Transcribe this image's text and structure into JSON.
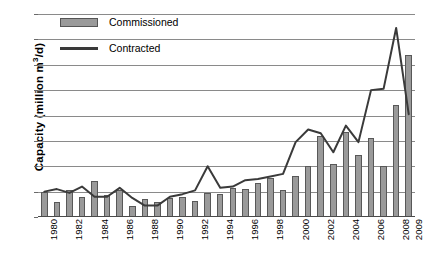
{
  "chart_data": {
    "type": "bar",
    "title": "",
    "xlabel": "",
    "ylabel": "Capacity (million m3/d)",
    "ylabel_prefix": "Capacity (million m",
    "ylabel_sup": "3",
    "ylabel_suffix": "/d)",
    "ylim": [
      0,
      8
    ],
    "yticks": [
      0,
      1,
      2,
      3,
      4,
      5,
      6,
      7,
      8
    ],
    "grid": true,
    "legend_position": "top-left",
    "categories": [
      "1980",
      "1981",
      "1982",
      "1983",
      "1984",
      "1985",
      "1986",
      "1987",
      "1988",
      "1989",
      "1990",
      "1991",
      "1992",
      "1993",
      "1994",
      "1995",
      "1996",
      "1997",
      "1998",
      "1999",
      "2000",
      "2001",
      "2002",
      "2003",
      "2004",
      "2005",
      "2006",
      "2007",
      "2008",
      "2009"
    ],
    "xtick_labels": [
      "1980",
      "",
      "1982",
      "",
      "1984",
      "",
      "1986",
      "",
      "1988",
      "",
      "1990",
      "",
      "1992",
      "",
      "1994",
      "",
      "1996",
      "",
      "1998",
      "",
      "2000",
      "",
      "2002",
      "",
      "2004",
      "",
      "2006",
      "",
      "2008",
      "2009"
    ],
    "series": [
      {
        "name": "Commissioned",
        "type": "bar",
        "color": "#9a9a9a",
        "edge_color": "#585858",
        "values": [
          1.0,
          0.58,
          1.05,
          0.8,
          1.4,
          0.85,
          1.05,
          0.45,
          0.7,
          0.6,
          0.75,
          0.8,
          0.65,
          0.95,
          0.9,
          1.15,
          1.1,
          1.35,
          1.55,
          1.05,
          1.6,
          2.0,
          3.2,
          2.1,
          3.35,
          2.45,
          3.1,
          2.0,
          4.4,
          6.4
        ]
      },
      {
        "name": "Contracted",
        "type": "line",
        "color": "#3a3a3a",
        "values": [
          1.0,
          1.1,
          0.95,
          1.2,
          0.8,
          0.8,
          1.15,
          0.75,
          0.45,
          0.45,
          0.8,
          0.9,
          1.05,
          2.0,
          1.15,
          1.2,
          1.45,
          1.5,
          1.6,
          1.7,
          2.95,
          3.45,
          3.3,
          2.55,
          3.6,
          2.95,
          5.0,
          5.05,
          7.45,
          4.05
        ]
      }
    ]
  },
  "legend": {
    "items": [
      {
        "label": "Commissioned",
        "marker": "bar-swatch"
      },
      {
        "label": "Contracted",
        "marker": "line-swatch"
      }
    ]
  }
}
